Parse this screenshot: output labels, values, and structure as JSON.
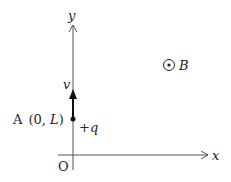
{
  "diagram": {
    "axes": {
      "x_label": "x",
      "y_label": "y",
      "origin_label": "O"
    },
    "point_A": {
      "name": "A",
      "coords_open": "(0, ",
      "coords_var": "L",
      "coords_close": ")"
    },
    "charge": {
      "sign": "+",
      "symbol": "q"
    },
    "velocity": {
      "symbol": "v"
    },
    "magnetic_field": {
      "symbol": "B",
      "direction": "out-of-page"
    },
    "colors": {
      "line": "#555555",
      "ink": "#222222",
      "background": "#ffffff"
    }
  }
}
